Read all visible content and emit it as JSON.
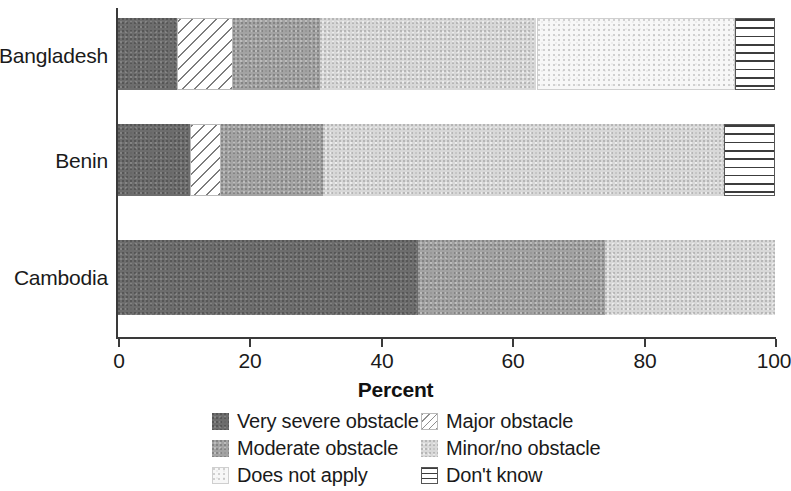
{
  "chart_data": {
    "type": "bar",
    "orientation": "horizontal",
    "stacked": true,
    "title": "",
    "xlabel": "Percent",
    "ylabel": "",
    "xlim": [
      0,
      100
    ],
    "xticks": [
      0,
      20,
      40,
      60,
      80,
      100
    ],
    "xtick_labels": [
      "0",
      "20",
      "40",
      "60",
      "80",
      "100"
    ],
    "grid": false,
    "legend_position": "bottom",
    "categories": [
      "Bangladesh",
      "Benin",
      "Cambodia"
    ],
    "series": [
      {
        "name": "Very severe obstacle",
        "key": "very_severe",
        "color": "#6d6d6d",
        "pattern": "solid-dark-gray",
        "values": [
          9.0,
          11.0,
          45.7
        ]
      },
      {
        "name": "Major obstacle",
        "key": "major",
        "color": "#ffffff",
        "pattern": "diagonal-hatch",
        "values": [
          8.5,
          4.7,
          0.0
        ]
      },
      {
        "name": "Moderate obstacle",
        "key": "moderate",
        "color": "#a3a3a3",
        "pattern": "solid-mid-gray",
        "values": [
          13.2,
          15.5,
          28.4
        ]
      },
      {
        "name": "Minor/no obstacle",
        "key": "minor",
        "color": "#d8d8d8",
        "pattern": "solid-light-gray",
        "values": [
          33.0,
          61.0,
          25.9
        ]
      },
      {
        "name": "Does not apply",
        "key": "does_not_apply",
        "color": "#f7f7f7",
        "pattern": "stipple-very-light",
        "values": [
          30.2,
          0.0,
          0.0
        ]
      },
      {
        "name": "Don't know",
        "key": "dont_know",
        "color": "#ffffff",
        "pattern": "horizontal-lines",
        "values": [
          6.1,
          7.8,
          0.0
        ]
      }
    ]
  },
  "axis": {
    "x_title": "Percent",
    "tick_labels": [
      "0",
      "20",
      "40",
      "60",
      "80",
      "100"
    ],
    "tick_values": [
      0,
      20,
      40,
      60,
      80,
      100
    ]
  },
  "category_labels": [
    "Bangladesh",
    "Benin",
    "Cambodia"
  ],
  "legend": {
    "rows": [
      {
        "left": "Very severe obstacle",
        "right": "Major obstacle"
      },
      {
        "left": "Moderate obstacle",
        "right": "Minor/no obstacle"
      },
      {
        "left": "Does not apply",
        "right": "Don't know"
      }
    ],
    "entries": [
      "Very severe obstacle",
      "Major obstacle",
      "Moderate obstacle",
      "Minor/no obstacle",
      "Does not apply",
      "Don't know"
    ]
  }
}
